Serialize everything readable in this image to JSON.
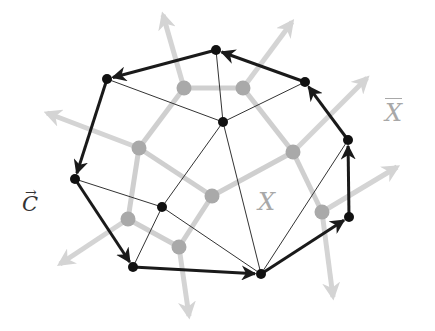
{
  "figure": {
    "labels": {
      "c_vec": "C",
      "c_vec_arrow": "→",
      "x": "X",
      "x_bar": "X"
    },
    "colors": {
      "background": "#ffffff",
      "primal_edge": "#1a1a1a",
      "primal_node": "#111111",
      "dual_edge": "#cfcfcf",
      "dual_node": "#a9a9a9",
      "dual_arrow": "#d4d4d4"
    },
    "primal_nodes": [
      {
        "id": "p0",
        "x": 216,
        "y": 50
      },
      {
        "id": "p1",
        "x": 107,
        "y": 79
      },
      {
        "id": "p2",
        "x": 75,
        "y": 179
      },
      {
        "id": "p3",
        "x": 133,
        "y": 267
      },
      {
        "id": "p4",
        "x": 261,
        "y": 274
      },
      {
        "id": "p5",
        "x": 349,
        "y": 217
      },
      {
        "id": "p6",
        "x": 348,
        "y": 140
      },
      {
        "id": "p7",
        "x": 305,
        "y": 82
      },
      {
        "id": "p8",
        "x": 223,
        "y": 122
      },
      {
        "id": "p9",
        "x": 162,
        "y": 207
      }
    ],
    "boundary_cycle_directed": [
      [
        "p0",
        "p1"
      ],
      [
        "p1",
        "p2"
      ],
      [
        "p2",
        "p3"
      ],
      [
        "p3",
        "p4"
      ],
      [
        "p4",
        "p5"
      ],
      [
        "p5",
        "p6"
      ],
      [
        "p6",
        "p7"
      ],
      [
        "p7",
        "p0"
      ]
    ],
    "interior_edges": [
      [
        "p1",
        "p8"
      ],
      [
        "p0",
        "p8"
      ],
      [
        "p7",
        "p8"
      ],
      [
        "p8",
        "p9"
      ],
      [
        "p8",
        "p4"
      ],
      [
        "p2",
        "p9"
      ],
      [
        "p9",
        "p3"
      ],
      [
        "p9",
        "p4"
      ],
      [
        "p4",
        "p6"
      ]
    ],
    "dual_nodes": [
      {
        "id": "d0",
        "x": 184,
        "y": 88
      },
      {
        "id": "d1",
        "x": 243,
        "y": 88
      },
      {
        "id": "d2",
        "x": 139,
        "y": 148
      },
      {
        "id": "d3",
        "x": 293,
        "y": 152
      },
      {
        "id": "d4",
        "x": 212,
        "y": 196
      },
      {
        "id": "d5",
        "x": 128,
        "y": 219
      },
      {
        "id": "d6",
        "x": 179,
        "y": 247
      },
      {
        "id": "d7",
        "x": 322,
        "y": 212
      }
    ],
    "dual_edges": [
      [
        "d0",
        "d1"
      ],
      [
        "d0",
        "d2"
      ],
      [
        "d1",
        "d3"
      ],
      [
        "d2",
        "d4"
      ],
      [
        "d3",
        "d4"
      ],
      [
        "d2",
        "d5"
      ],
      [
        "d5",
        "d6"
      ],
      [
        "d4",
        "d6"
      ],
      [
        "d3",
        "d7"
      ]
    ],
    "dual_outer_arrows": [
      {
        "from": "d0",
        "to": [
          163,
          15
        ]
      },
      {
        "from": "d1",
        "to": [
          292,
          22
        ]
      },
      {
        "from": "d2",
        "to": [
          47,
          113
        ]
      },
      {
        "from": "d3",
        "to": [
          367,
          78
        ]
      },
      {
        "from": "d5",
        "to": [
          60,
          264
        ]
      },
      {
        "from": "d6",
        "to": [
          189,
          316
        ]
      },
      {
        "from": "d7",
        "to": [
          397,
          167
        ]
      },
      {
        "from": "d7",
        "to": [
          333,
          297
        ]
      }
    ]
  }
}
